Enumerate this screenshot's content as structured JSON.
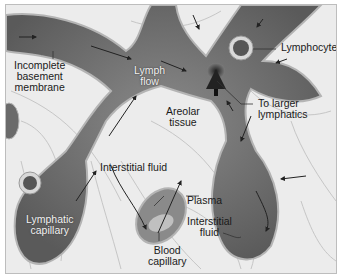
{
  "figure": {
    "palette": {
      "background": "#ececec",
      "tissue_lines": "#c8c8c8",
      "vessel_fill": "#7a7a7a",
      "vessel_dark": "#4a4a4a",
      "vessel_edge": "#b4b4b4",
      "text": "#1a1a1a",
      "text_inverse": "#f2f2f2"
    },
    "labels": {
      "incomplete_basement_membrane": [
        "Incomplete",
        "basement",
        "membrane"
      ],
      "lymph_flow": [
        "Lymph",
        "flow"
      ],
      "lymphocyte": "Lymphocyte",
      "to_larger_lymphatics": [
        "To larger",
        "lymphatics"
      ],
      "areolar_tissue": [
        "Areolar",
        "tissue"
      ],
      "interstitial_fluid_top": "Interstitial fluid",
      "plasma": "Plasma",
      "lymphatic_capillary": [
        "Lymphatic",
        "capillary"
      ],
      "blood_capillary": [
        "Blood",
        "capillary"
      ],
      "interstitial_fluid_right": [
        "Interstitial",
        "fluid"
      ]
    }
  }
}
